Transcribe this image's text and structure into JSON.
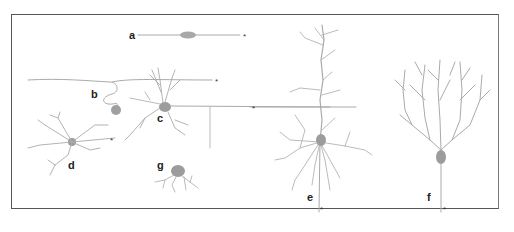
{
  "figure": {
    "type": "neuron-morphology-diagram",
    "colors": {
      "neuron": "#a9a9a9",
      "soma": "#9a9a9a",
      "frame": "#555555",
      "label": "#222222"
    },
    "labels": [
      {
        "id": "a",
        "text": "a"
      },
      {
        "id": "b",
        "text": "b"
      },
      {
        "id": "c",
        "text": "c"
      },
      {
        "id": "d",
        "text": "d"
      },
      {
        "id": "e",
        "text": "e"
      },
      {
        "id": "f",
        "text": "f"
      },
      {
        "id": "g",
        "text": "g"
      }
    ],
    "axon_marker": "*"
  }
}
